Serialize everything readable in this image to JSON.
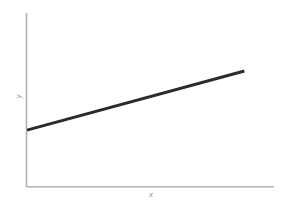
{
  "figure": {
    "width": 286,
    "height": 211,
    "background_color": "#ffffff",
    "clipped_top_caption": "",
    "axis_color": "#b2b2b5",
    "line_color": "#2b2b2b",
    "label_color": "#8d8d90"
  },
  "chart_data": {
    "type": "line",
    "title": "",
    "xlabel": "x",
    "ylabel": "y",
    "grid": false,
    "legend": null,
    "xlim": [
      0,
      1
    ],
    "ylim": [
      0,
      1
    ],
    "xticks": [],
    "yticks": [],
    "xticklabels": [],
    "yticklabels": [],
    "series": [
      {
        "name": "linear trend",
        "color": "#2b2b2b",
        "linewidth": 3,
        "x": [
          0.0,
          0.88
        ],
        "y": [
          0.327,
          0.667
        ]
      }
    ],
    "annotations": []
  }
}
